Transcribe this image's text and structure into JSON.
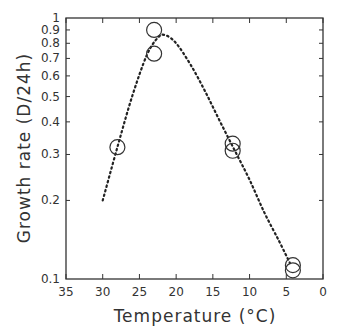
{
  "chart_data": {
    "type": "scatter",
    "title": "",
    "xlabel": "Temperature (°C)",
    "ylabel": "Growth rate (D/24h)",
    "xlim": [
      35,
      0
    ],
    "x_reversed": true,
    "ylim": [
      0.1,
      1
    ],
    "y_scale": "log",
    "grid": false,
    "legend": null,
    "x_ticks": [
      35,
      30,
      25,
      20,
      15,
      10,
      5,
      0
    ],
    "y_ticks": [
      1,
      0.9,
      0.8,
      0.7,
      0.6,
      0.5,
      0.4,
      0.3,
      0.2,
      0.1
    ],
    "y_tick_labels": [
      "1",
      "0.9",
      "0.8",
      "0.7",
      "0.6",
      "0.5",
      "0.4",
      "0.3",
      "0.2",
      "0.1"
    ],
    "series": [
      {
        "name": "Observed",
        "kind": "scatter",
        "marker": "open-circle",
        "points": [
          {
            "x": 28,
            "y": 0.32
          },
          {
            "x": 23,
            "y": 0.9
          },
          {
            "x": 23,
            "y": 0.73
          },
          {
            "x": 12.3,
            "y": 0.33
          },
          {
            "x": 12.3,
            "y": 0.31
          },
          {
            "x": 4.1,
            "y": 0.113
          },
          {
            "x": 4.1,
            "y": 0.108
          }
        ]
      },
      {
        "name": "Fitted curve",
        "kind": "line",
        "style": "dotted",
        "points": [
          {
            "x": 30,
            "y": 0.2
          },
          {
            "x": 28,
            "y": 0.32
          },
          {
            "x": 26,
            "y": 0.5
          },
          {
            "x": 24,
            "y": 0.72
          },
          {
            "x": 22.5,
            "y": 0.84
          },
          {
            "x": 21.5,
            "y": 0.86
          },
          {
            "x": 20,
            "y": 0.8
          },
          {
            "x": 18,
            "y": 0.66
          },
          {
            "x": 16,
            "y": 0.52
          },
          {
            "x": 14,
            "y": 0.4
          },
          {
            "x": 12,
            "y": 0.31
          },
          {
            "x": 10,
            "y": 0.24
          },
          {
            "x": 8,
            "y": 0.18
          },
          {
            "x": 6,
            "y": 0.14
          },
          {
            "x": 4.5,
            "y": 0.115
          }
        ]
      }
    ]
  }
}
